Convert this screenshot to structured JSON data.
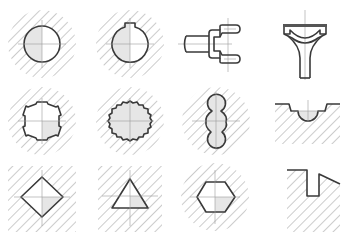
{
  "diagram": {
    "title": "",
    "colors": {
      "outline": "#3a3a3a",
      "hatch": "#8e8e8e",
      "centerline": "#9a9a9a",
      "section_fill": "#e6e6e6",
      "background": "#ffffff"
    },
    "figures": [
      {
        "id": 1,
        "row": 1,
        "col": 1,
        "shape": "round-hole"
      },
      {
        "id": 2,
        "row": 1,
        "col": 2,
        "shape": "round-hole-with-keyway"
      },
      {
        "id": 3,
        "row": 1,
        "col": 3,
        "shape": "fork-yoke"
      },
      {
        "id": 4,
        "row": 1,
        "col": 4,
        "shape": "bearing-cap-rod"
      },
      {
        "id": 5,
        "row": 2,
        "col": 1,
        "shape": "splined-hole"
      },
      {
        "id": 6,
        "row": 2,
        "col": 2,
        "shape": "serrated-hole"
      },
      {
        "id": 7,
        "row": 2,
        "col": 3,
        "shape": "figure-eight-profile"
      },
      {
        "id": 8,
        "row": 2,
        "col": 4,
        "shape": "semicircular-groove"
      },
      {
        "id": 9,
        "row": 3,
        "col": 1,
        "shape": "square-hole"
      },
      {
        "id": 10,
        "row": 3,
        "col": 2,
        "shape": "triangular-hole"
      },
      {
        "id": 11,
        "row": 3,
        "col": 3,
        "shape": "hexagonal-hole"
      },
      {
        "id": 12,
        "row": 3,
        "col": 4,
        "shape": "rectangular-slot-notch"
      }
    ]
  }
}
